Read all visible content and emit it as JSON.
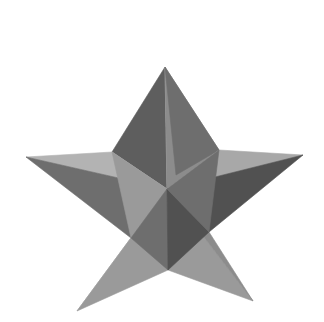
{
  "figure": {
    "label": "B",
    "caption_position": "top-center",
    "background_color": "#ffffff",
    "label_color": "#1b1b1b",
    "width": 324,
    "height": 322
  },
  "object": {
    "name": "star-polyhedron",
    "description": "Five-pointed 3D faceted star (stellated pentagonal dipyramid) rendered in grayscale shading",
    "point_count": 5,
    "render_style": "flat-shaded-facets"
  },
  "palette": {
    "facet_lightest": "#c2c2c2",
    "facet_light": "#b3b3b3",
    "facet_light_mid": "#a8a8a8",
    "facet_mid": "#9a9a9a",
    "facet_mid_dark": "#8c8c8c",
    "facet_dark": "#6e6e6e",
    "facet_darker": "#5e5e5e",
    "facet_darkest": "#515151",
    "background": "#ffffff"
  },
  "geometry": {
    "center": {
      "x": 167,
      "y": 189
    },
    "outer_tips": [
      {
        "name": "top",
        "x": 165,
        "y": 67
      },
      {
        "name": "left",
        "x": 26,
        "y": 157
      },
      {
        "name": "right",
        "x": 303,
        "y": 155
      },
      {
        "name": "bottom-left",
        "x": 77,
        "y": 311
      },
      {
        "name": "bottom-right",
        "x": 253,
        "y": 301
      }
    ],
    "inner_vertices": [
      {
        "name": "upper-left",
        "x": 112,
        "y": 152
      },
      {
        "name": "upper-right",
        "x": 219,
        "y": 150
      },
      {
        "name": "lower-left",
        "x": 131,
        "y": 238
      },
      {
        "name": "lower-right",
        "x": 209,
        "y": 232
      },
      {
        "name": "bottom",
        "x": 168,
        "y": 270
      }
    ]
  },
  "facets": [
    {
      "id": "top-left-dark",
      "points": "165,67 112,152 167,189",
      "fill": "#5e5e5e"
    },
    {
      "id": "top-left-light",
      "points": "165,67 167,189 176,175",
      "fill": "#b3b3b3"
    },
    {
      "id": "top-right-mid",
      "points": "165,67 219,150 167,189",
      "fill": "#8c8c8c"
    },
    {
      "id": "top-right-darker",
      "points": "165,67 176,175 219,150",
      "fill": "#6e6e6e"
    },
    {
      "id": "left-arm-light",
      "points": "26,157 112,152 167,189",
      "fill": "#b3b3b3"
    },
    {
      "id": "left-arm-dark",
      "points": "26,157 167,189 131,238",
      "fill": "#6e6e6e"
    },
    {
      "id": "right-arm-light",
      "points": "303,155 219,150 167,189",
      "fill": "#a8a8a8"
    },
    {
      "id": "right-arm-dark",
      "points": "303,155 167,189 209,232",
      "fill": "#515151"
    },
    {
      "id": "bl-leg-light",
      "points": "77,311 131,238 167,189",
      "fill": "#c2c2c2"
    },
    {
      "id": "bl-leg-mid",
      "points": "77,311 167,189 168,270",
      "fill": "#9a9a9a"
    },
    {
      "id": "br-leg-mid",
      "points": "253,301 168,270 167,189",
      "fill": "#9a9a9a"
    },
    {
      "id": "br-leg-light",
      "points": "253,301 167,189 209,232",
      "fill": "#8c8c8c"
    },
    {
      "id": "core-upper-left",
      "points": "112,152 167,189 131,238",
      "fill": "#9a9a9a"
    },
    {
      "id": "core-lower-left",
      "points": "131,238 167,189 168,270",
      "fill": "#6e6e6e"
    },
    {
      "id": "core-lower-right",
      "points": "168,270 167,189 209,232",
      "fill": "#515151"
    },
    {
      "id": "core-upper-right",
      "points": "209,232 167,189 219,150",
      "fill": "#6e6e6e"
    }
  ]
}
